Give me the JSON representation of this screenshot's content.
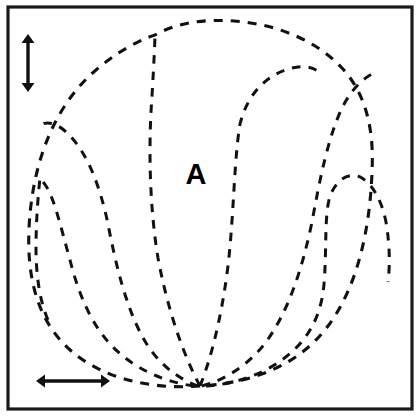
{
  "figure": {
    "background_color": "#ffffff",
    "ink_color": "#111111",
    "frame": {
      "name": "outer-border",
      "stroke_color": "#1b1b1b",
      "stroke_width": 3.2,
      "x": 8,
      "y": 7,
      "width": 404,
      "height": 402
    },
    "labels": [
      {
        "id": "region-a",
        "text": "A",
        "x": 196,
        "y": 176,
        "font_size": 29,
        "weight": "bold",
        "color": "#000000"
      }
    ],
    "scale_bars": [
      {
        "id": "vertical-scale-arrow",
        "orientation": "vertical",
        "double_headed": true,
        "x": 28,
        "y_start": 34,
        "y_end": 92,
        "color": "#111111"
      },
      {
        "id": "horizontal-scale-arrow",
        "orientation": "horizontal",
        "double_headed": true,
        "y": 381,
        "x_start": 36,
        "x_end": 110,
        "color": "#111111"
      }
    ],
    "line_style": {
      "dash_on": 9,
      "dash_off": 8,
      "stroke_width": 3.1
    },
    "contours": [
      {
        "id": "outer-boundary",
        "role": "outer-silhouette",
        "closed": false,
        "path": "M 200 386 C 150 390 95 378 62 342 C 30 307 26 258 30 214 C 35 160 54 106 96 70 C 126 44 152 36 155 35 C 178 22 206 19 234 21 C 276 24 316 40 342 68 C 368 96 374 134 372 172 C 370 228 358 286 328 326 C 298 366 252 383 200 386 Z"
      },
      {
        "id": "petal-center",
        "role": "central-petal",
        "closed": false,
        "path": "M 200 386 C 184 356 168 312 158 258 C 150 210 148 150 152 96 C 154 62 155 40 155 35"
      },
      {
        "id": "petal-center-right-edge",
        "role": "central-petal-right",
        "closed": false,
        "path": "M 200 386 C 212 356 222 314 228 266 C 234 214 234 160 240 124 C 248 92 268 74 292 68 C 308 64 318 70 322 75"
      },
      {
        "id": "petal-right-inner",
        "role": "right-inner-petal",
        "closed": false,
        "path": "M 202 386 C 224 380 248 366 266 342 C 288 312 302 270 312 222 C 320 178 328 138 342 108 C 352 88 364 78 372 74"
      },
      {
        "id": "petal-right-lobe",
        "role": "right-lobe",
        "closed": false,
        "path": "M 206 386 C 238 384 272 372 296 348 C 314 330 322 308 324 284 C 327 248 324 216 330 196 C 338 176 352 172 362 178 C 374 186 382 202 386 222 C 390 246 390 266 388 282"
      },
      {
        "id": "petal-left-inner",
        "role": "left-inner-petal",
        "closed": false,
        "path": "M 198 386 C 176 378 156 362 142 336 C 126 306 116 266 108 224 C 100 186 88 156 72 138 C 58 122 46 120 40 126"
      },
      {
        "id": "petal-left-lobe",
        "role": "left-lobe",
        "closed": false,
        "path": "M 194 386 C 164 382 132 368 110 344 C 90 322 78 292 70 260 C 60 224 54 198 46 186 C 42 180 40 179 40 178 C 38 196 36 222 36 248 C 36 276 40 302 48 320"
      }
    ]
  }
}
